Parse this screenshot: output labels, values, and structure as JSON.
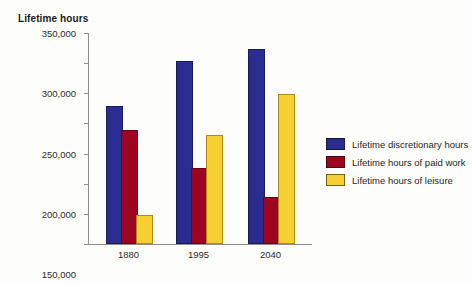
{
  "chart_data": {
    "type": "bar",
    "title": "Lifetime hours",
    "xlabel": "",
    "ylabel": "Lifetime hours",
    "categories": [
      "1880",
      "1995",
      "2040"
    ],
    "series": [
      {
        "name": "Lifetime discretionary hours",
        "color": "#2a2d8f",
        "values": [
          225000,
          300000,
          320000
        ]
      },
      {
        "name": "Lifetime hours of paid work",
        "color": "#9d0420",
        "values": [
          185000,
          122000,
          75000
        ]
      },
      {
        "name": "Lifetime hours of leisure",
        "color": "#f6cf33",
        "values": [
          45000,
          177000,
          245000
        ]
      }
    ],
    "ylim": [
      0,
      350000
    ],
    "y_ticks": [
      0,
      50000,
      100000,
      150000,
      200000,
      250000,
      300000,
      350000
    ],
    "y_tick_labels": [
      "0",
      "50,000",
      "100,000",
      "150,000",
      "200,000",
      "250,000",
      "300,000",
      "350,000"
    ],
    "grid": false,
    "legend_position": "right"
  },
  "legend": {
    "items": [
      {
        "label": "Lifetime discretionary hours"
      },
      {
        "label": "Lifetime hours of paid work"
      },
      {
        "label": "Lifetime hours of leisure"
      }
    ]
  }
}
